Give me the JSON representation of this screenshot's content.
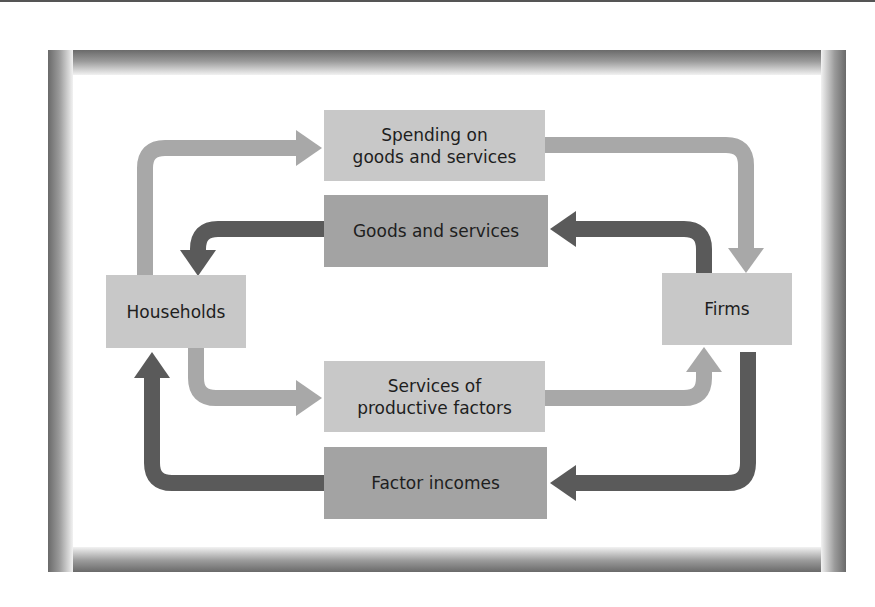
{
  "diagram": {
    "type": "circular-flow",
    "colors": {
      "light_box": "#c8c8c8",
      "medium_box": "#a3a3a3",
      "light_arrow": "#a8a8a8",
      "dark_arrow": "#5a5a5a",
      "frame_dark": "#6a6a6a"
    },
    "nodes": {
      "households": {
        "label": "Households"
      },
      "firms": {
        "label": "Firms"
      }
    },
    "flows": {
      "spending": {
        "line1": "Spending on",
        "line2": "goods and services",
        "direction": "households-to-firms"
      },
      "goods": {
        "label": "Goods and services",
        "direction": "firms-to-households"
      },
      "factor_services": {
        "line1": "Services of",
        "line2": "productive factors",
        "direction": "households-to-firms"
      },
      "factor_incomes": {
        "label": "Factor incomes",
        "direction": "firms-to-households"
      }
    }
  }
}
